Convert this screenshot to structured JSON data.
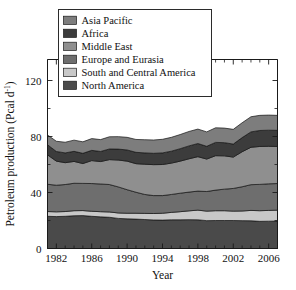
{
  "chart_data": {
    "type": "area",
    "stacked": true,
    "title": "",
    "xlabel": "Year",
    "ylabel": "Petroleum production (Pcal d⁻¹)",
    "ylabel_base": "Petroleum production (Pcal d",
    "ylabel_sup": "-1",
    "ylabel_tail": ")",
    "xlim": [
      1981,
      2007
    ],
    "ylim": [
      0,
      135
    ],
    "yticks": [
      0,
      40,
      80,
      120
    ],
    "ytick_labels": [
      "0",
      "40",
      "80",
      "120"
    ],
    "xticks": [
      1982,
      1986,
      1990,
      1994,
      1998,
      2002,
      2006
    ],
    "xtick_labels": [
      "1982",
      "1986",
      "1990",
      "1994",
      "1998",
      "2002",
      "2006"
    ],
    "xminor_step": 1,
    "grid": false,
    "legend_position": "top-center",
    "x": [
      1981,
      1982,
      1983,
      1984,
      1985,
      1986,
      1987,
      1988,
      1989,
      1990,
      1991,
      1992,
      1993,
      1994,
      1995,
      1996,
      1997,
      1998,
      1999,
      2000,
      2001,
      2002,
      2003,
      2004,
      2005,
      2006,
      2007
    ],
    "series": [
      {
        "name": "North America",
        "color": "#4a4a4a",
        "values": [
          23.0,
          22.8,
          23.0,
          23.4,
          23.5,
          23.0,
          22.6,
          22.3,
          21.5,
          21.2,
          21.0,
          20.7,
          20.4,
          20.3,
          20.5,
          20.5,
          20.6,
          20.5,
          19.9,
          20.0,
          20.0,
          20.0,
          19.9,
          19.8,
          19.4,
          19.5,
          19.6
        ]
      },
      {
        "name": "South and Central America",
        "color": "#c8c8c8",
        "values": [
          3.4,
          3.4,
          3.4,
          3.6,
          3.6,
          3.6,
          3.7,
          3.8,
          3.9,
          4.0,
          4.2,
          4.4,
          4.6,
          4.9,
          5.3,
          5.8,
          6.3,
          6.9,
          6.8,
          7.0,
          7.0,
          6.7,
          6.9,
          7.4,
          7.6,
          7.7,
          7.8
        ]
      },
      {
        "name": "Europe and Eurasia",
        "color": "#6e6e6e",
        "values": [
          19.5,
          19.0,
          19.3,
          19.6,
          19.4,
          19.8,
          19.8,
          19.6,
          18.6,
          16.8,
          15.0,
          13.5,
          12.8,
          12.6,
          12.8,
          13.2,
          13.4,
          13.6,
          14.0,
          14.7,
          15.4,
          16.2,
          17.3,
          18.4,
          18.8,
          19.0,
          19.0
        ]
      },
      {
        "name": "Middle East",
        "color": "#8f8f8f",
        "values": [
          21.0,
          17.2,
          15.6,
          15.6,
          14.2,
          16.4,
          16.0,
          17.8,
          19.2,
          20.4,
          20.4,
          21.6,
          22.1,
          22.2,
          22.4,
          22.9,
          23.8,
          24.6,
          23.2,
          24.6,
          23.8,
          22.4,
          25.0,
          26.7,
          27.1,
          26.8,
          26.5
        ]
      },
      {
        "name": "Africa",
        "color": "#3c3c3c",
        "values": [
          7.2,
          6.9,
          7.0,
          7.2,
          7.3,
          7.3,
          7.2,
          7.6,
          7.8,
          8.0,
          8.1,
          8.1,
          8.1,
          8.3,
          8.5,
          8.9,
          9.2,
          9.4,
          9.1,
          9.5,
          9.4,
          9.3,
          10.1,
          11.0,
          11.4,
          11.5,
          11.5
        ]
      },
      {
        "name": "Asia Pacific",
        "color": "#7d7d7d",
        "values": [
          7.0,
          7.3,
          7.6,
          8.0,
          8.2,
          8.4,
          8.5,
          8.7,
          8.9,
          9.0,
          9.2,
          9.4,
          9.5,
          9.7,
          9.9,
          10.1,
          10.3,
          10.3,
          10.3,
          10.4,
          10.4,
          10.5,
          10.6,
          10.8,
          10.8,
          10.8,
          10.7
        ]
      }
    ],
    "legend_order": [
      "Asia Pacific",
      "Africa",
      "Middle East",
      "Europe and Eurasia",
      "South and Central America",
      "North America"
    ],
    "legend_entries": [
      {
        "label": "Asia Pacific",
        "color": "#7d7d7d"
      },
      {
        "label": "Africa",
        "color": "#3c3c3c"
      },
      {
        "label": "Middle East",
        "color": "#8f8f8f"
      },
      {
        "label": "Europe and Eurasia",
        "color": "#6e6e6e"
      },
      {
        "label": "South and Central America",
        "color": "#c8c8c8"
      },
      {
        "label": "North America",
        "color": "#4a4a4a"
      }
    ]
  }
}
